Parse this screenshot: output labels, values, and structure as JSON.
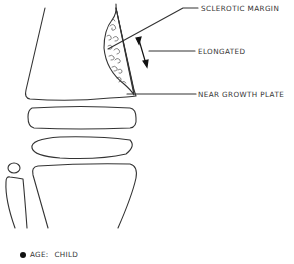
{
  "diagram": {
    "labels": {
      "sclerotic_margin": "SCLEROTIC MARGIN",
      "elongated": "ELONGATED",
      "near_growth_plate": "NEAR GROWTH PLATE"
    },
    "legend": {
      "key": "AGE:",
      "value": "CHILD"
    },
    "colors": {
      "stroke": "#333333",
      "text": "#333333",
      "bullet": "#111111"
    }
  }
}
